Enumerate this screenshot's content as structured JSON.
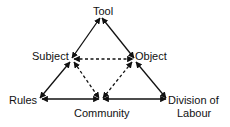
{
  "diagram": {
    "nodes": {
      "tool": "Tool",
      "subject": "Subject",
      "object": "Object",
      "rules": "Rules",
      "community": "Community",
      "division_line1": "Division of",
      "division_line2": "Labour"
    },
    "edges": [
      {
        "from": "Tool",
        "to": "Subject",
        "style": "solid",
        "bidirectional": true
      },
      {
        "from": "Tool",
        "to": "Object",
        "style": "solid",
        "bidirectional": true
      },
      {
        "from": "Subject",
        "to": "Rules",
        "style": "solid",
        "bidirectional": true
      },
      {
        "from": "Object",
        "to": "Division of Labour",
        "style": "solid",
        "bidirectional": true
      },
      {
        "from": "Rules",
        "to": "Community",
        "style": "solid",
        "bidirectional": true
      },
      {
        "from": "Community",
        "to": "Division of Labour",
        "style": "solid",
        "bidirectional": true
      },
      {
        "from": "Subject",
        "to": "Object",
        "style": "dashed",
        "bidirectional": true
      },
      {
        "from": "Subject",
        "to": "Community",
        "style": "dashed",
        "bidirectional": true
      },
      {
        "from": "Object",
        "to": "Community",
        "style": "dashed",
        "bidirectional": true
      }
    ],
    "colors": {
      "line": "#111111",
      "background": "#ffffff"
    }
  }
}
